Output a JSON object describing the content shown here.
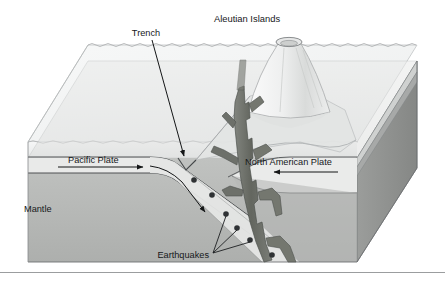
{
  "figure": {
    "kind": "block-diagram",
    "background_color": "#ffffff"
  },
  "labels": {
    "aleutian_islands": "Aleutian Islands",
    "trench": "Trench",
    "pacific_plate": "Pacific Plate",
    "north_american_plate": "North American Plate",
    "mantle": "Mantle",
    "earthquakes": "Earthquakes"
  },
  "icons": {
    "volcano": "volcano-icon",
    "magma_plume": "magma-plume-icon",
    "earthquake_dot": "earthquake-dot-icon",
    "trench_pointer": "trench-pointer-icon",
    "pacific_motion_arrow": "arrow-right-icon",
    "north_american_motion_arrow": "arrow-left-icon",
    "subduction_arrow": "arrow-down-right-icon",
    "ocean_surface": "wavy-water-line-icon",
    "footer_rule": "horizontal-rule-icon"
  },
  "colors": {
    "background": "#ffffff",
    "water": "#eef0f0",
    "water_top": "#f4f5f5",
    "seafloor_top": "#e4e5e4",
    "crust_band": "#e9eae9",
    "mantle": "#b8bab8",
    "mantle_side": "#9a9c9a",
    "mantle_side_dark": "#8a8c8a",
    "magma": "#6f7270",
    "magma_dark": "#5d605e",
    "volcano_light": "#f2f3f3",
    "volcano_shade": "#d6d8d7",
    "outline": "#55585a",
    "outline_soft": "#8d9092",
    "text": "#16181a",
    "leader": "#1d1f21",
    "footer_rule": "#9b9d9f"
  },
  "annotations": {
    "earthquake_count": 6,
    "leader_lines_from_earthquakes_label": 3,
    "plate_motion": {
      "pacific": "right",
      "north_american": "left"
    }
  }
}
